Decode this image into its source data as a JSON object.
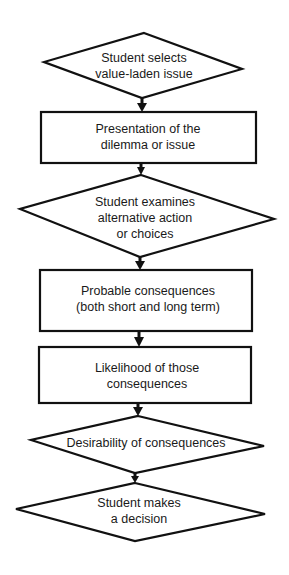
{
  "diagram": {
    "type": "flowchart",
    "direction": "top-to-bottom",
    "colors": {
      "stroke": "#111111",
      "fill": "#ffffff",
      "text": "#1a1a1a",
      "background": "#ffffff"
    },
    "nodes": [
      {
        "id": "n1",
        "shape": "diamond",
        "lines": [
          "Student selects",
          "value-laden issue"
        ]
      },
      {
        "id": "n2",
        "shape": "rectangle",
        "lines": [
          "Presentation of the",
          "dilemma or issue"
        ]
      },
      {
        "id": "n3",
        "shape": "diamond",
        "lines": [
          "Student examines",
          "alternative action",
          "or choices"
        ]
      },
      {
        "id": "n4",
        "shape": "rectangle",
        "lines": [
          "Probable consequences",
          "(both short and long term)"
        ]
      },
      {
        "id": "n5",
        "shape": "rectangle",
        "lines": [
          "Likelihood of those",
          "consequences"
        ]
      },
      {
        "id": "n6",
        "shape": "diamond",
        "lines": [
          "Desirability of consequences"
        ]
      },
      {
        "id": "n7",
        "shape": "diamond",
        "lines": [
          "Student makes",
          "a decision"
        ]
      }
    ],
    "edges": [
      {
        "from": "n1",
        "to": "n2"
      },
      {
        "from": "n2",
        "to": "n3"
      },
      {
        "from": "n3",
        "to": "n4"
      },
      {
        "from": "n4",
        "to": "n5"
      },
      {
        "from": "n5",
        "to": "n6"
      },
      {
        "from": "n6",
        "to": "n7"
      }
    ]
  }
}
